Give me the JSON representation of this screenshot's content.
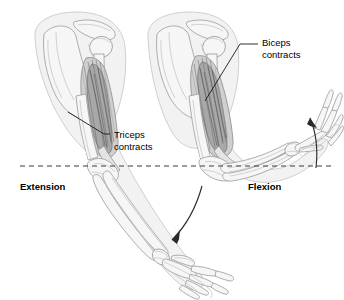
{
  "figure": {
    "background_color": "#ffffff",
    "ink_color": "#1a1a1a",
    "width": 344,
    "height": 300
  },
  "annotations": {
    "biceps": {
      "line1": "Biceps",
      "line2": "contracts",
      "text_x": 262,
      "text_y": 46,
      "leader_from_x": 205,
      "leader_from_y": 101,
      "leader_to_x": 258,
      "leader_to_y": 43
    },
    "triceps": {
      "line1": "Triceps",
      "line2": "contracts",
      "text_x": 113,
      "text_y": 138,
      "leader_from_x": 68,
      "leader_from_y": 112,
      "leader_to_x": 110,
      "leader_to_y": 134
    }
  },
  "position_labels": {
    "extension": {
      "text": "Extension",
      "x": 20,
      "y": 190
    },
    "flexion": {
      "text": "Flexion",
      "x": 248,
      "y": 190
    }
  },
  "reference_line": {
    "name": "horizontal-reference-dashed-line",
    "x_start": 20,
    "x_end": 332,
    "y": 166,
    "dash_pattern": "5 4",
    "color": "#3a3a3a"
  },
  "motion_arrows": [
    {
      "name": "extension-motion-arrow",
      "direction": "downward",
      "description": "curved arrow sweeping down from the flexed elbow to the extended hand",
      "color": "#2b2b2b"
    },
    {
      "name": "flexion-motion-arrow",
      "direction": "upward",
      "description": "curved arrow sweeping up from the reference line toward the flexed hand",
      "color": "#2b2b2b"
    }
  ],
  "limbs": [
    {
      "name": "left-arm-extended",
      "state": "Extension",
      "active_muscle": "Triceps",
      "muscle_state": "contracts"
    },
    {
      "name": "right-arm-flexed",
      "state": "Flexion",
      "active_muscle": "Biceps",
      "muscle_state": "contracts"
    }
  ]
}
